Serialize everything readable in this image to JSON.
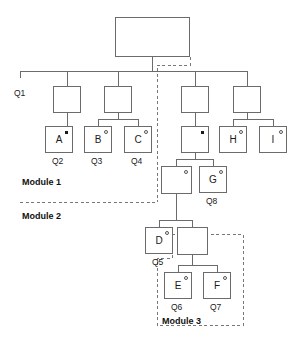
{
  "diagram": {
    "line_color": "#6b6b6b",
    "dashed_color": "#777777",
    "text_color": "#1a1a1a",
    "background": "#ffffff"
  },
  "nodes": [
    {
      "id": "root",
      "label": "",
      "marker": "none",
      "x": 115,
      "y": 17,
      "w": 75,
      "h": 40
    },
    {
      "id": "n1",
      "label": "",
      "marker": "none",
      "x": 53,
      "y": 86,
      "w": 28,
      "h": 27
    },
    {
      "id": "n2",
      "label": "",
      "marker": "none",
      "x": 104,
      "y": 86,
      "w": 28,
      "h": 27
    },
    {
      "id": "n3",
      "label": "",
      "marker": "none",
      "x": 181,
      "y": 86,
      "w": 28,
      "h": 27
    },
    {
      "id": "n4",
      "label": "",
      "marker": "none",
      "x": 233,
      "y": 86,
      "w": 28,
      "h": 27
    },
    {
      "id": "A",
      "label": "A",
      "marker": "star",
      "x": 45,
      "y": 126,
      "w": 28,
      "h": 27
    },
    {
      "id": "B",
      "label": "B",
      "marker": "circle",
      "x": 84,
      "y": 126,
      "w": 28,
      "h": 27
    },
    {
      "id": "C",
      "label": "C",
      "marker": "circle",
      "x": 124,
      "y": 126,
      "w": 28,
      "h": 27
    },
    {
      "id": "n5",
      "label": "",
      "marker": "star",
      "x": 181,
      "y": 126,
      "w": 28,
      "h": 27
    },
    {
      "id": "H",
      "label": "H",
      "marker": "circle",
      "x": 219,
      "y": 126,
      "w": 28,
      "h": 27
    },
    {
      "id": "I",
      "label": "I",
      "marker": "circle",
      "x": 259,
      "y": 126,
      "w": 28,
      "h": 27
    },
    {
      "id": "n6",
      "label": "",
      "marker": "circle",
      "x": 161,
      "y": 166,
      "w": 31,
      "h": 28
    },
    {
      "id": "G",
      "label": "G",
      "marker": "circle",
      "x": 199,
      "y": 166,
      "w": 28,
      "h": 27
    },
    {
      "id": "D",
      "label": "D",
      "marker": "circle",
      "x": 145,
      "y": 227,
      "w": 28,
      "h": 27
    },
    {
      "id": "n7",
      "label": "",
      "marker": "none",
      "x": 177,
      "y": 227,
      "w": 31,
      "h": 28
    },
    {
      "id": "E",
      "label": "E",
      "marker": "circle",
      "x": 164,
      "y": 272,
      "w": 28,
      "h": 27
    },
    {
      "id": "F",
      "label": "F",
      "marker": "circle",
      "x": 203,
      "y": 272,
      "w": 28,
      "h": 27
    }
  ],
  "q_labels": [
    {
      "text": "Q1",
      "x": 14,
      "y": 89
    },
    {
      "text": "Q2",
      "x": 52,
      "y": 157
    },
    {
      "text": "Q3",
      "x": 91,
      "y": 157
    },
    {
      "text": "Q4",
      "x": 131,
      "y": 157
    },
    {
      "text": "Q8",
      "x": 206,
      "y": 197
    },
    {
      "text": "Q5",
      "x": 152,
      "y": 258
    },
    {
      "text": "Q6",
      "x": 171,
      "y": 303
    },
    {
      "text": "Q7",
      "x": 210,
      "y": 303
    }
  ],
  "module_labels": [
    {
      "text": "Module 1",
      "x": 22,
      "y": 178
    },
    {
      "text": "Module 2",
      "x": 22,
      "y": 212
    },
    {
      "text": "Module 3",
      "x": 162,
      "y": 317
    }
  ],
  "solid_edges": [
    {
      "from": "root-bottom",
      "d": "M 152.5 57 L 152.5 71"
    },
    {
      "from": "bus-tier1",
      "d": "M 20 71 L 247 71"
    },
    {
      "from": "bus-left-end",
      "d": "M 20 71 L 20 78"
    },
    {
      "from": "n1-up",
      "d": "M 67 71 L 67 86"
    },
    {
      "from": "n2-up",
      "d": "M 118 71 L 118 86"
    },
    {
      "from": "n3-up",
      "d": "M 195 71 L 195 86"
    },
    {
      "from": "n4-up",
      "d": "M 247 71 L 247 86"
    },
    {
      "from": "n1-A",
      "d": "M 67 113 L 67 126"
    },
    {
      "from": "n2-down",
      "d": "M 118 113 L 118 119"
    },
    {
      "from": "n2-bus",
      "d": "M 98 119 L 138 119"
    },
    {
      "from": "n2-B",
      "d": "M 98 119 L 98 126"
    },
    {
      "from": "n2-C",
      "d": "M 138 119 L 138 126"
    },
    {
      "from": "n3-n5",
      "d": "M 195 113 L 195 126"
    },
    {
      "from": "n4-down",
      "d": "M 247 113 L 247 119"
    },
    {
      "from": "n4-bus",
      "d": "M 233 119 L 273 119"
    },
    {
      "from": "n4-H",
      "d": "M 233 119 L 233 126"
    },
    {
      "from": "n4-I",
      "d": "M 273 119 L 273 126"
    },
    {
      "from": "n5-down",
      "d": "M 195 153 L 195 159"
    },
    {
      "from": "n5-bus",
      "d": "M 176 159 L 213 159"
    },
    {
      "from": "n5-n6",
      "d": "M 176 159 L 176 166"
    },
    {
      "from": "n5-G",
      "d": "M 213 159 L 213 166"
    },
    {
      "from": "n6-down",
      "d": "M 176 194 L 176 220"
    },
    {
      "from": "n6-bus",
      "d": "M 159 220 L 192 220"
    },
    {
      "from": "n6-D",
      "d": "M 159 220 L 159 227"
    },
    {
      "from": "n6-n7",
      "d": "M 192 220 L 192 227"
    },
    {
      "from": "n7-down",
      "d": "M 192 255 L 192 265"
    },
    {
      "from": "n7-bus",
      "d": "M 178 265 L 217 265"
    },
    {
      "from": "n7-E",
      "d": "M 178 265 L 178 272"
    },
    {
      "from": "n7-F",
      "d": "M 217 265 L 217 272"
    }
  ],
  "dashed_edges": [
    {
      "name": "module-boundary-vertical",
      "d": "M 190 57 L 190 65 L 157 65 L 157 202"
    },
    {
      "name": "module-1-2-divider",
      "d": "M 20 202 L 157 202"
    },
    {
      "name": "module-3-boundary",
      "d": "M 172 234 L 243 234 L 243 325 L 157 325 L 157 258 L 172 258 L 172 234"
    }
  ]
}
